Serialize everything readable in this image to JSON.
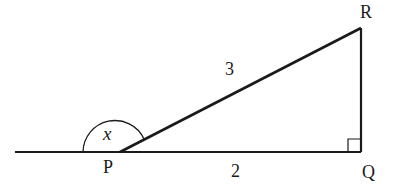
{
  "diagram": {
    "type": "right-triangle",
    "points": {
      "P": {
        "label": "P",
        "x": 120,
        "y": 152
      },
      "Q": {
        "label": "Q",
        "x": 361,
        "y": 152
      },
      "R": {
        "label": "R",
        "x": 361,
        "y": 28
      }
    },
    "baseline": {
      "x1": 15,
      "x2": 361,
      "y": 152
    },
    "sides": {
      "PR": {
        "label": "3"
      },
      "PQ": {
        "label": "2"
      }
    },
    "angle": {
      "vertex": "P",
      "label": "x",
      "description": "exterior angle at P between extended line and PR"
    },
    "right_angle_at": "Q",
    "colors": {
      "stroke": "#1a1a1a",
      "background": "#ffffff"
    }
  }
}
